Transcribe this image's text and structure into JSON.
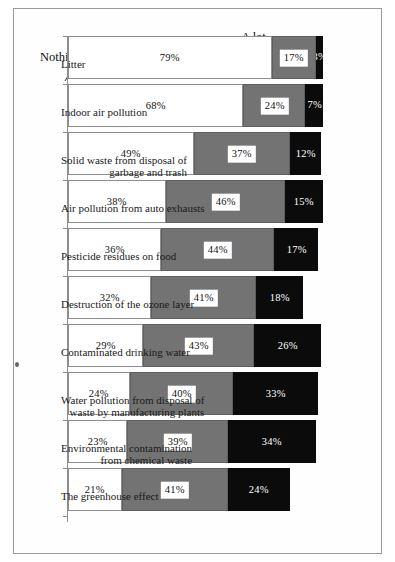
{
  "chart_data": {
    "type": "bar",
    "subtype": "stacked-bar-100",
    "orientation": "vertical-printed-rotated",
    "title": "",
    "xlabel": "",
    "ylabel": "",
    "ylim": [
      0,
      100
    ],
    "grid": false,
    "legend_position": "above-first-bars",
    "value_suffix": "%",
    "categories": [
      "Litter",
      "Indoor air pollution",
      "Solid waste from disposal of garbage and trash",
      "Air pollution from auto exhausts",
      "Pesticide residues on food",
      "Destruction of the ozone layer",
      "Contaminated drinking water",
      "Water pollution from disposal of waste by manufacturing plants",
      "Environmental contamination from chemical waste",
      "The greenhouse effect"
    ],
    "category_lines": [
      [
        "Litter"
      ],
      [
        "Indoor air pollution"
      ],
      [
        "Solid waste from disposal of",
        "garbage and trash"
      ],
      [
        "Air pollution from auto exhausts"
      ],
      [
        "Pesticide residues on food"
      ],
      [
        "Destruction of the ozone layer"
      ],
      [
        "Contaminated drinking water"
      ],
      [
        "Water pollution from disposal of",
        "waste by manufacturing plants"
      ],
      [
        "Environmental contamination",
        "from chemical waste"
      ],
      [
        "The greenhouse effect"
      ]
    ],
    "series": [
      {
        "name": "A lot",
        "key": "alot",
        "color": "#ffffff",
        "values": [
          79,
          68,
          49,
          38,
          36,
          32,
          29,
          24,
          23,
          21
        ],
        "labels": [
          "79%",
          "68%",
          "49%",
          "38%",
          "36%",
          "32%",
          "29%",
          "24%",
          "23%",
          "21%"
        ]
      },
      {
        "name": "A little",
        "key": "alittle",
        "color": "#737373",
        "values": [
          17,
          24,
          37,
          46,
          44,
          41,
          43,
          40,
          39,
          41
        ],
        "labels": [
          "17%",
          "24%",
          "37%",
          "46%",
          "44%",
          "41%",
          "43%",
          "40%",
          "39%",
          "41%"
        ]
      },
      {
        "name": "Nothing",
        "key": "nothing",
        "color": "#0b0b0b",
        "values": [
          3,
          7,
          12,
          15,
          17,
          18,
          26,
          33,
          34,
          24
        ],
        "labels": [
          "3%",
          "7%",
          "12%",
          "15%",
          "17%",
          "18%",
          "26%",
          "33%",
          "34%",
          "24%"
        ]
      }
    ]
  },
  "legend": {
    "alot": "A lot",
    "alittle": "A little",
    "nothing": "Nothing"
  }
}
